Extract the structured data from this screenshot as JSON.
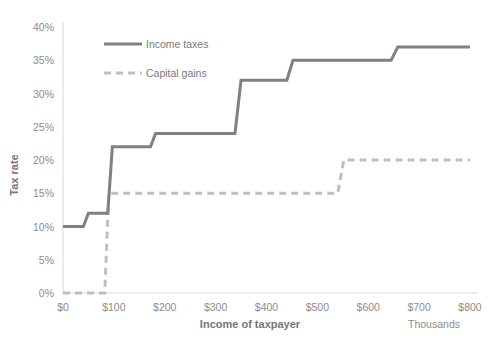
{
  "chart_data": {
    "type": "line",
    "title": "",
    "xlabel": "Income of taxpayer",
    "ylabel": "Tax rate",
    "x_unit_note": "Thousands",
    "xlim": [
      0,
      800
    ],
    "ylim": [
      0,
      0.4
    ],
    "grid": false,
    "legend_position": "inside-upper-left",
    "x_ticks": [
      "$0",
      "$100",
      "$200",
      "$300",
      "$400",
      "$500",
      "$600",
      "$700",
      "$800"
    ],
    "x_tick_values": [
      0,
      100,
      200,
      300,
      400,
      500,
      600,
      700,
      800
    ],
    "y_ticks": [
      "0%",
      "5%",
      "10%",
      "15%",
      "20%",
      "25%",
      "30%",
      "35%",
      "40%"
    ],
    "y_tick_values": [
      0,
      5,
      10,
      15,
      20,
      25,
      30,
      35,
      40
    ],
    "series": [
      {
        "name": "Income taxes",
        "style": "solid",
        "color": "#808080",
        "step": true,
        "points": [
          {
            "x": 0,
            "y": 10
          },
          {
            "x": 40,
            "y": 10
          },
          {
            "x": 50,
            "y": 12
          },
          {
            "x": 88,
            "y": 12
          },
          {
            "x": 97,
            "y": 22
          },
          {
            "x": 172,
            "y": 22
          },
          {
            "x": 182,
            "y": 24
          },
          {
            "x": 338,
            "y": 24
          },
          {
            "x": 350,
            "y": 32
          },
          {
            "x": 440,
            "y": 32
          },
          {
            "x": 452,
            "y": 35
          },
          {
            "x": 645,
            "y": 35
          },
          {
            "x": 658,
            "y": 37
          },
          {
            "x": 800,
            "y": 37
          }
        ]
      },
      {
        "name": "Capital gains",
        "style": "dashed",
        "color": "#bfbfbf",
        "step": true,
        "points": [
          {
            "x": 0,
            "y": 0
          },
          {
            "x": 82,
            "y": 0
          },
          {
            "x": 90,
            "y": 15
          },
          {
            "x": 540,
            "y": 15
          },
          {
            "x": 552,
            "y": 20
          },
          {
            "x": 800,
            "y": 20
          }
        ]
      }
    ]
  },
  "legend": {
    "items": [
      {
        "label": "Income taxes",
        "color": "#808080",
        "style": "solid"
      },
      {
        "label": "Capital gains",
        "color": "#bfbfbf",
        "style": "dashed"
      }
    ]
  }
}
